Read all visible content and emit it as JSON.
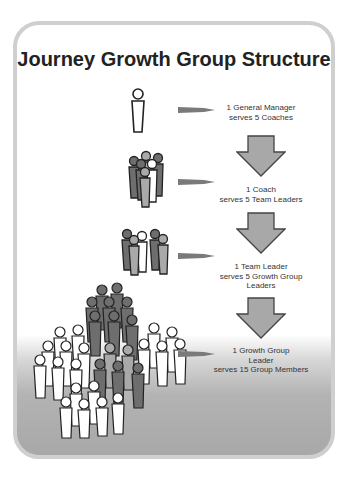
{
  "title": "Journey Growth Group Structure",
  "colors": {
    "card_border": "#cfcfcf",
    "arrow_fill": "#a8a8a8",
    "arrow_stroke": "#444444",
    "figure_dark": "#6e6e6e",
    "figure_mid": "#a9a9a9",
    "figure_light": "#ffffff",
    "figure_outline": "#222222"
  },
  "levels": [
    {
      "id": "general-manager",
      "line1": "1 General Manager",
      "line2": "serves 5 Coaches",
      "line3": ""
    },
    {
      "id": "coach",
      "line1": "1 Coach",
      "line2": "serves 5 Team Leaders",
      "line3": ""
    },
    {
      "id": "team-leader",
      "line1": "1 Team Leader",
      "line2": "serves 5 Growth Group",
      "line3": "Leaders"
    },
    {
      "id": "growth-group-leader",
      "line1": "1 Growth Group",
      "line2": "Leader",
      "line3": "serves 15 Group Members"
    }
  ],
  "icons": {
    "pointer": "right-pointer-arrow",
    "step": "down-block-arrow",
    "person": "person-figure"
  }
}
